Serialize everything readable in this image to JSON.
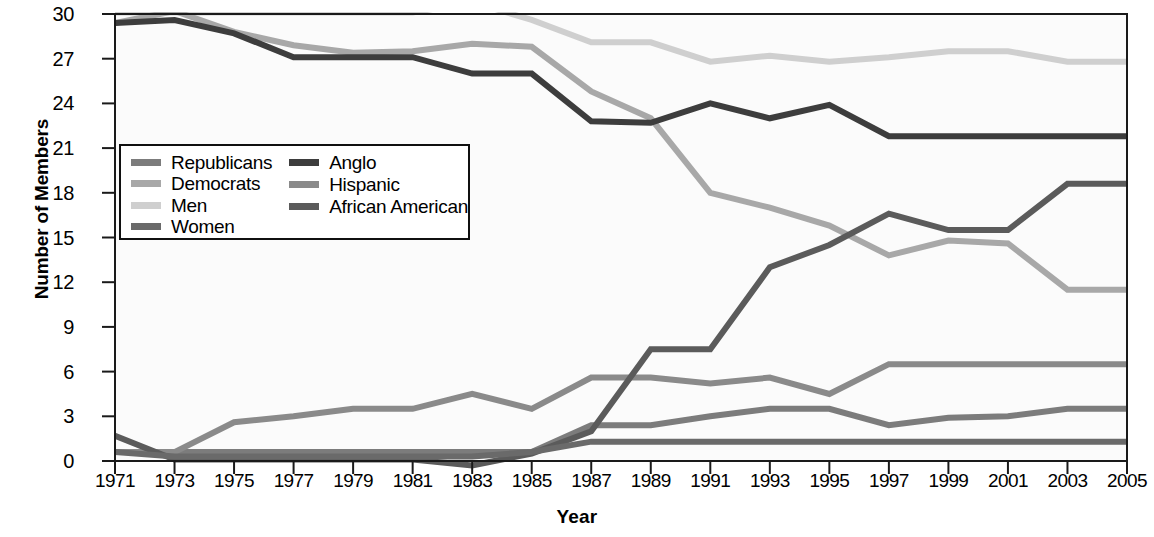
{
  "chart_data": {
    "type": "line",
    "title": "",
    "xlabel": "Year",
    "ylabel": "Number of Members",
    "x": [
      1971,
      1973,
      1975,
      1977,
      1979,
      1981,
      1983,
      1985,
      1987,
      1989,
      1991,
      1993,
      1995,
      1997,
      1999,
      2001,
      2003,
      2005
    ],
    "xlim": [
      1971,
      2005
    ],
    "ylim": [
      -1,
      31
    ],
    "yticks": [
      0,
      3,
      6,
      9,
      12,
      15,
      18,
      21,
      24,
      27,
      30
    ],
    "xticks": [
      "1971",
      "1973",
      "1975",
      "1977",
      "1979",
      "1981",
      "1983",
      "1985",
      "1987",
      "1989",
      "1991",
      "1993",
      "1995",
      "1997",
      "1999",
      "2001",
      "2003",
      "2005"
    ],
    "grid": false,
    "legend_position": "upper-left-inside",
    "series": [
      {
        "name": "Republicans",
        "color": "#7c7c7c",
        "values": [
          0.6,
          0.6,
          0.6,
          0.6,
          0.6,
          0.6,
          0.6,
          0.6,
          2.4,
          2.4,
          3.0,
          3.5,
          3.5,
          2.4,
          2.9,
          3.0,
          3.5,
          3.5
        ]
      },
      {
        "name": "Democrats",
        "color": "#a8a8a8",
        "values": [
          29.4,
          30.2,
          28.8,
          27.9,
          27.4,
          27.5,
          28.0,
          27.8,
          24.8,
          23.0,
          18.0,
          17.0,
          15.8,
          13.8,
          14.8,
          14.6,
          11.5,
          11.5
        ]
      },
      {
        "name": "Men",
        "color": "#cfcfcf",
        "values": [
          30.1,
          30.1,
          30.1,
          30.1,
          30.1,
          30.1,
          30.8,
          29.6,
          28.1,
          28.1,
          26.8,
          27.2,
          26.8,
          27.1,
          27.5,
          27.5,
          26.8,
          26.8
        ]
      },
      {
        "name": "Women",
        "color": "#6a6a6a",
        "values": [
          0.6,
          0.3,
          0.3,
          0.3,
          0.3,
          0.3,
          0.3,
          0.6,
          1.3,
          1.3,
          1.3,
          1.3,
          1.3,
          1.3,
          1.3,
          1.3,
          1.3,
          1.3
        ]
      },
      {
        "name": "Anglo",
        "color": "#3d3d3d",
        "values": [
          29.4,
          29.6,
          28.7,
          27.1,
          27.1,
          27.1,
          26.0,
          26.0,
          22.8,
          22.7,
          24.0,
          23.0,
          23.9,
          21.8,
          21.8,
          21.8,
          21.8,
          21.8
        ]
      },
      {
        "name": "Hispanic",
        "color": "#8a8a8a",
        "values": [
          0.6,
          0.6,
          2.6,
          3.0,
          3.5,
          3.5,
          4.5,
          3.5,
          5.6,
          5.6,
          5.2,
          5.6,
          4.5,
          6.5,
          6.5,
          6.5,
          6.5,
          6.5
        ]
      },
      {
        "name": "African American",
        "color": "#5b5b5b",
        "values": [
          1.7,
          0.1,
          0.1,
          0.1,
          0.1,
          0.1,
          -0.3,
          0.5,
          2.0,
          7.5,
          7.5,
          13.0,
          14.5,
          16.6,
          15.5,
          15.5,
          18.6,
          18.6
        ]
      }
    ]
  },
  "legend": {
    "columns": [
      {
        "entries": [
          {
            "label": "Republicans",
            "color": "#7c7c7c",
            "icon": "legend-line-swatch"
          },
          {
            "label": "Democrats",
            "color": "#a8a8a8",
            "icon": "legend-line-swatch"
          },
          {
            "label": "Men",
            "color": "#cfcfcf",
            "icon": "legend-line-swatch"
          },
          {
            "label": "Women",
            "color": "#6a6a6a",
            "icon": "legend-line-swatch"
          }
        ]
      },
      {
        "entries": [
          {
            "label": "Anglo",
            "color": "#3d3d3d",
            "icon": "legend-line-swatch"
          },
          {
            "label": "Hispanic",
            "color": "#8a8a8a",
            "icon": "legend-line-swatch"
          },
          {
            "label": "African American",
            "color": "#5b5b5b",
            "icon": "legend-line-swatch"
          }
        ]
      }
    ]
  },
  "axes": {
    "frame_color": "#1a1a1a",
    "plot_background": "#fbfbfb"
  }
}
